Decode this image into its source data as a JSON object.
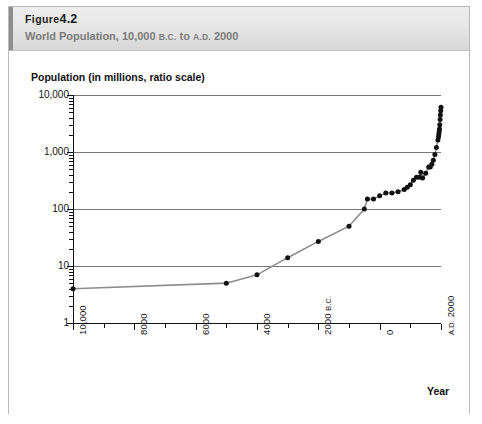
{
  "figure": {
    "number_prefix": "Figure",
    "number": "4.2",
    "subtitle_main": "World Population, 10,000",
    "subtitle_era1": "B.C.",
    "subtitle_mid": "to",
    "subtitle_era2": "A.D.",
    "subtitle_end": "2000",
    "subtitle_full": "World Population, 10,000 B.C. to A.D. 2000"
  },
  "chart_data": {
    "type": "line",
    "title": "World Population, 10,000 B.C. to A.D. 2000",
    "xlabel": "Year",
    "ylabel": "Population (in millions, ratio scale)",
    "yscale": "log",
    "ylim": [
      1,
      10000
    ],
    "xlim": [
      -10000,
      2000
    ],
    "grid": true,
    "legend": false,
    "line_color": "#8c8c8c",
    "marker_color": "#111111",
    "ytick_values": [
      1,
      10,
      100,
      1000,
      10000
    ],
    "ytick_labels": [
      "1",
      "10",
      "100",
      "1,000",
      "10,000"
    ],
    "xtick_values": [
      -10000,
      -8000,
      -6000,
      -4000,
      -2000,
      0,
      2000
    ],
    "xtick_labels": [
      "10,000",
      "8000",
      "6000",
      "4000",
      "2000 B.C.",
      "0",
      "A.D. 2000"
    ],
    "xtick_minor_values": [
      -9000,
      -7000,
      -5000,
      -3000,
      -1000,
      1000
    ],
    "series": [
      {
        "name": "World population",
        "x": [
          -10000,
          -5000,
          -4000,
          -3000,
          -2000,
          -1000,
          -500,
          -400,
          -200,
          0,
          200,
          400,
          600,
          800,
          900,
          1000,
          1100,
          1200,
          1300,
          1340,
          1400,
          1500,
          1600,
          1650,
          1700,
          1750,
          1800,
          1850,
          1900,
          1920,
          1930,
          1940,
          1950,
          1960,
          1970,
          1980,
          1990,
          2000
        ],
        "y": [
          4,
          5,
          7,
          14,
          27,
          50,
          100,
          150,
          150,
          170,
          190,
          190,
          200,
          220,
          240,
          265,
          320,
          360,
          360,
          440,
          350,
          425,
          545,
          545,
          610,
          720,
          900,
          1200,
          1625,
          1860,
          2070,
          2300,
          2520,
          3020,
          3700,
          4440,
          5270,
          6070
        ]
      }
    ]
  }
}
